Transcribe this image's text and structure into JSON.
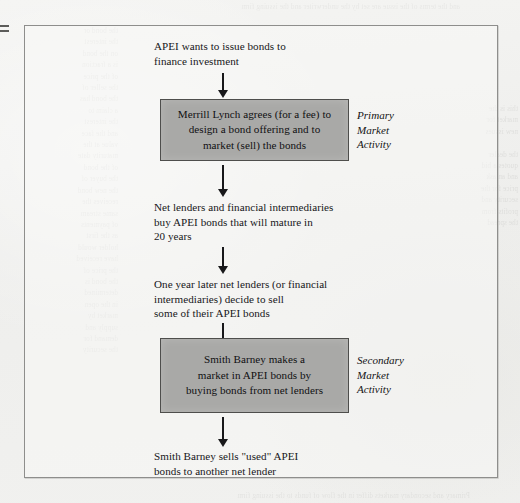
{
  "figure": {
    "type": "flowchart",
    "orientation": "vertical",
    "colors": {
      "page_background": "#f1f1ef",
      "frame_border": "#8e8e8c",
      "box_fill": "#a9a9a7",
      "box_border": "#4e4e4c",
      "text": "#17171a",
      "arrow": "#18181a"
    },
    "steps": [
      {
        "id": "step-1",
        "kind": "text",
        "text": "APEI wants to issue bonds to\nfinance investment"
      },
      {
        "id": "step-2",
        "kind": "box",
        "text": "Merrill Lynch agrees (for a fee) to\ndesign a bond offering and to\nmarket (sell) the bonds",
        "side_label": "Primary\nMarket\nActivity"
      },
      {
        "id": "step-3",
        "kind": "text",
        "text": "Net lenders and financial intermediaries\nbuy APEI bonds that will mature in\n20 years"
      },
      {
        "id": "step-4",
        "kind": "text",
        "text": "One year later net lenders (or financial\nintermediaries) decide to sell\nsome of their APEI bonds"
      },
      {
        "id": "step-5",
        "kind": "box",
        "text": "Smith Barney makes a\nmarket in APEI bonds by\nbuying bonds from net lenders",
        "side_label": "Secondary\nMarket\nActivity"
      },
      {
        "id": "step-6",
        "kind": "text",
        "text": "Smith Barney sells \"used\" APEI\nbonds to another net lender"
      }
    ],
    "connectors": [
      {
        "id": "arrow-1",
        "from": "step-1",
        "to": "step-2"
      },
      {
        "id": "arrow-2",
        "from": "step-2",
        "to": "step-3"
      },
      {
        "id": "arrow-3",
        "from": "step-3",
        "to": "step-4"
      },
      {
        "id": "arrow-4",
        "from": "step-4",
        "to": "step-5"
      },
      {
        "id": "arrow-5",
        "from": "step-5",
        "to": "step-6"
      }
    ]
  },
  "scan": {
    "ghost_left": "the bond or\nthe interest\non the bond\nis a fraction\nof the price\nthe seller of\nthe bond has\na claim to\nthe interest\nand the face\nvalue at the\nmaturity date\nof the bond\nthe buyer of\nthe new bond\nreceives the\nsame stream\nof payments\nas the first\nholder would\nhave received\nthe price of\nthe bond is\ndetermined\nin the open\nmarket by\nsupply and\ndemand for\nthe security",
    "ghost_right": "this is the\nmarket for\nnew issues\n\nthe dealer\nquotes a bid\nand an ask\nprice for the\nsecurity and\nprofits from\nthe spread",
    "ghost_top": "and the terms of the issue are set by the underwriter and the issuing firm",
    "ghost_bottom": "Primary and secondary markets differ in the flow of funds to the issuing firm"
  }
}
